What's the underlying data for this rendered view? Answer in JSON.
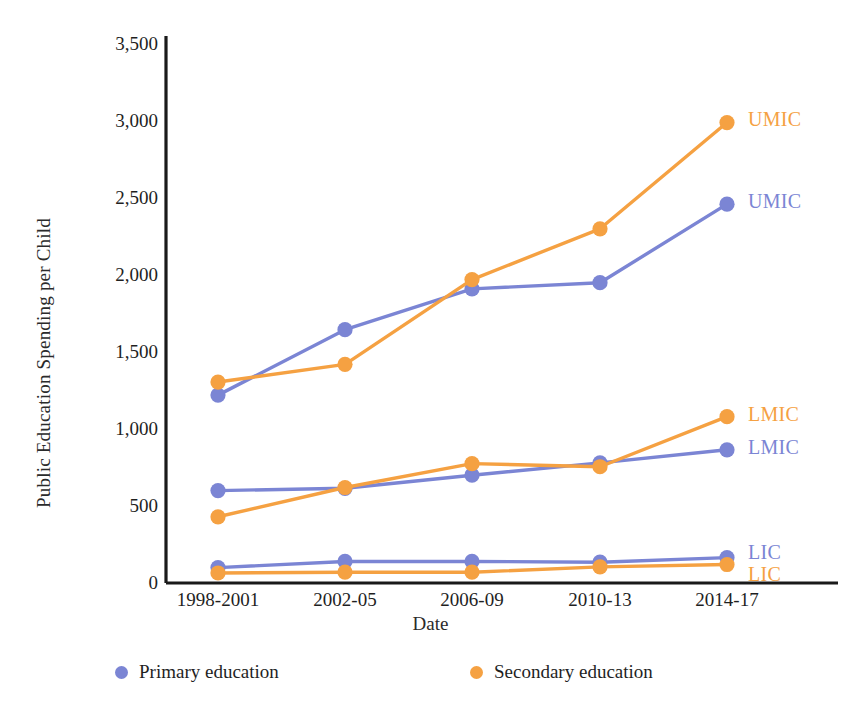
{
  "chart_data": {
    "type": "line",
    "title": "",
    "xlabel": "Date",
    "ylabel": "Public Education Spending per Child",
    "x": [
      "1998-2001",
      "2002-05",
      "2006-09",
      "2010-13",
      "2014-17"
    ],
    "categories": [
      "1998-2001",
      "2002-05",
      "2006-09",
      "2010-13",
      "2014-17"
    ],
    "ylim": [
      0,
      3500
    ],
    "yticks": [
      0,
      500,
      1000,
      1500,
      2000,
      2500,
      3000,
      3500
    ],
    "ytick_labels": [
      "0",
      "500",
      "1,000",
      "1,500",
      "2,000",
      "2,500",
      "3,000",
      "3,500"
    ],
    "grid": false,
    "legend_position": "bottom",
    "legend": [
      {
        "name": "Primary education",
        "color": "#7b85d4"
      },
      {
        "name": "Secondary education",
        "color": "#f5a142"
      }
    ],
    "series": [
      {
        "name": "UMIC Primary education",
        "group": "UMIC",
        "education": "Primary education",
        "color": "#7b85d4",
        "end_label": "UMIC",
        "values": [
          1220,
          1645,
          1910,
          1950,
          2460
        ]
      },
      {
        "name": "UMIC Secondary education",
        "group": "UMIC",
        "education": "Secondary education",
        "color": "#f5a142",
        "end_label": "UMIC",
        "values": [
          1305,
          1420,
          1970,
          2300,
          2990
        ]
      },
      {
        "name": "LMIC Primary education",
        "group": "LMIC",
        "education": "Primary education",
        "color": "#7b85d4",
        "end_label": "LMIC",
        "values": [
          600,
          615,
          700,
          780,
          865
        ]
      },
      {
        "name": "LMIC Secondary education",
        "group": "LMIC",
        "education": "Secondary education",
        "color": "#f5a142",
        "end_label": "LMIC",
        "values": [
          430,
          620,
          775,
          755,
          1080
        ]
      },
      {
        "name": "LIC Primary education",
        "group": "LIC",
        "education": "Primary education",
        "color": "#7b85d4",
        "end_label": "LIC",
        "values": [
          100,
          140,
          140,
          135,
          165
        ]
      },
      {
        "name": "LIC Secondary education",
        "group": "LIC",
        "education": "Secondary education",
        "color": "#f5a142",
        "end_label": "LIC",
        "values": [
          65,
          70,
          70,
          105,
          120
        ]
      }
    ],
    "end_labels": [
      {
        "text": "UMIC",
        "color": "#f5a142",
        "value": 2990
      },
      {
        "text": "UMIC",
        "color": "#7b85d4",
        "value": 2460
      },
      {
        "text": "LMIC",
        "color": "#f5a142",
        "value": 1080
      },
      {
        "text": "LMIC",
        "color": "#7b85d4",
        "value": 865
      },
      {
        "text": "LIC",
        "color": "#7b85d4",
        "value": 165
      },
      {
        "text": "LIC",
        "color": "#f5a142",
        "value": 120
      }
    ]
  },
  "axis": {
    "line_color": "#1a1a1a"
  }
}
